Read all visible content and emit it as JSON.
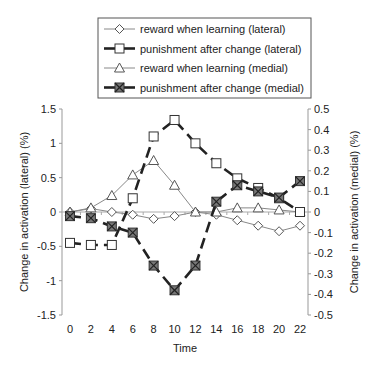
{
  "chart_data": {
    "type": "line",
    "title": "",
    "xlabel": "Time",
    "ylabel": "Change in activation (lateral) (%)",
    "y2label": "Change in activation (medial) (%)",
    "x": [
      0,
      2,
      4,
      6,
      8,
      10,
      12,
      14,
      16,
      18,
      20,
      22
    ],
    "x_ticks": [
      "0",
      "2",
      "4",
      "6",
      "8",
      "10",
      "12",
      "14",
      "16",
      "18",
      "20",
      "22"
    ],
    "ylim": [
      -1.5,
      1.5
    ],
    "y_ticks": [
      "1.5",
      "1",
      "0.5",
      "0",
      "-0.5",
      "-1",
      "-1.5"
    ],
    "y_tick_values": [
      1.5,
      1,
      0.5,
      0,
      -0.5,
      -1,
      -1.5
    ],
    "y2lim": [
      -0.5,
      0.5
    ],
    "y2_ticks": [
      "0.5",
      "0.4",
      "0.3",
      "0.2",
      "0.1",
      "0",
      "-0.1",
      "-0.2",
      "-0.3",
      "-0.4",
      "-0.5"
    ],
    "y2_tick_values": [
      0.5,
      0.4,
      0.3,
      0.2,
      0.1,
      0,
      -0.1,
      -0.2,
      -0.3,
      -0.4,
      -0.5
    ],
    "grid": false,
    "legend_position": "top",
    "series": [
      {
        "name": "reward when learning (lateral)",
        "axis": "left",
        "marker": "diamond",
        "line": "thin-solid",
        "values": [
          0,
          0.05,
          0,
          -0.04,
          -0.1,
          -0.06,
          0,
          -0.04,
          -0.12,
          -0.2,
          -0.28,
          -0.2
        ]
      },
      {
        "name": "punishment after change (lateral)",
        "axis": "left",
        "marker": "square",
        "line": "thick-dashed",
        "values": [
          -0.45,
          -0.48,
          -0.48,
          0.2,
          1.1,
          1.34,
          1.0,
          0.71,
          0.49,
          0.35,
          0.2,
          0.0
        ]
      },
      {
        "name": "reward when learning (medial)",
        "axis": "right",
        "marker": "triangle",
        "line": "thin-solid",
        "values": [
          0,
          0.02,
          0.08,
          0.18,
          0.25,
          0.13,
          0,
          0,
          0.02,
          0.02,
          0.01,
          0
        ]
      },
      {
        "name": "punishment after change (medial)",
        "axis": "right",
        "marker": "x-square",
        "line": "thick-dashed",
        "values": [
          -0.02,
          -0.03,
          -0.07,
          -0.1,
          -0.26,
          -0.38,
          -0.26,
          0.05,
          0.13,
          0.1,
          0.07,
          0.15
        ]
      }
    ]
  }
}
